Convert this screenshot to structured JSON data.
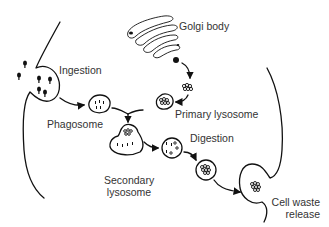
{
  "diagram": {
    "labels": {
      "golgi": "Golgi body",
      "ingestion": "Ingestion",
      "phagosome": "Phagosome",
      "primary_lysosome": "Primary lysosome",
      "digestion": "Digestion",
      "secondary_lysosome_line1": "Secondary",
      "secondary_lysosome_line2": "lysosome",
      "cell_waste_line1": "Cell waste",
      "cell_waste_line2": "release"
    },
    "colors": {
      "stroke": "#111111",
      "text": "#333333",
      "background": "#ffffff"
    }
  }
}
